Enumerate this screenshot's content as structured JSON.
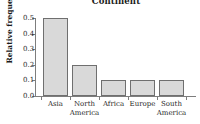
{
  "chart_data": {
    "type": "bar",
    "title": "Continent",
    "xlabel": "",
    "ylabel": "Relative frequency",
    "categories": [
      "Asia",
      "North America",
      "Africa",
      "Europe",
      "South America"
    ],
    "values": [
      0.5,
      0.2,
      0.1,
      0.1,
      0.1
    ],
    "ylim": [
      0.0,
      0.5
    ],
    "yticks": [
      "0.0",
      "0.1",
      "0.2",
      "0.3",
      "0.4",
      "0.5"
    ],
    "ytick_values": [
      0.0,
      0.1,
      0.2,
      0.3,
      0.4,
      0.5
    ],
    "grid": false,
    "legend": false,
    "bar_fill_color": "#d9d9d9",
    "bar_edge_color": "#6f6f6f",
    "axis_color": "#7d7d7d",
    "text_color": "#1b1b1b",
    "background_color": "#ffffff",
    "category_label_lines": [
      [
        "Asia",
        ""
      ],
      [
        "North",
        "America"
      ],
      [
        "Africa",
        ""
      ],
      [
        "Europe",
        ""
      ],
      [
        "South",
        "America"
      ]
    ]
  }
}
